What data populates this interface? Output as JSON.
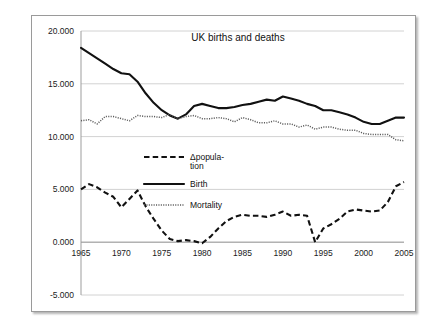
{
  "chart_data": {
    "type": "line",
    "title": "UK births and deaths",
    "xlabel": "",
    "ylabel": "",
    "xlim": [
      1965,
      2005
    ],
    "ylim": [
      -5.0,
      20.0
    ],
    "grid": true,
    "legend_position": "center",
    "xticks": [
      "1965",
      "1970",
      "1975",
      "1980",
      "1985",
      "1990",
      "1995",
      "2000",
      "2005"
    ],
    "yticks": [
      "-5.000",
      "0.000",
      "5.000",
      "10.000",
      "15.000",
      "20.000"
    ],
    "x": [
      1965,
      1966,
      1967,
      1968,
      1969,
      1970,
      1971,
      1972,
      1973,
      1974,
      1975,
      1976,
      1977,
      1978,
      1979,
      1980,
      1981,
      1982,
      1983,
      1984,
      1985,
      1986,
      1987,
      1988,
      1989,
      1990,
      1991,
      1992,
      1993,
      1994,
      1995,
      1996,
      1997,
      1998,
      1999,
      2000,
      2001,
      2002,
      2003,
      2004,
      2005
    ],
    "series": [
      {
        "name": "Δpopula-tion",
        "legend_label": "Δpopula-",
        "legend_label_line2": "tion",
        "style": "dashed",
        "color": "#111111",
        "values": [
          5.0,
          5.5,
          5.2,
          4.7,
          4.3,
          3.3,
          4.1,
          4.9,
          3.4,
          2.2,
          1.1,
          0.3,
          0.1,
          0.2,
          0.1,
          -0.1,
          0.5,
          1.3,
          2.0,
          2.4,
          2.6,
          2.5,
          2.5,
          2.4,
          2.6,
          2.9,
          2.5,
          2.6,
          2.5,
          0.0,
          1.3,
          1.7,
          2.2,
          2.9,
          3.1,
          3.0,
          2.9,
          3.0,
          3.8,
          5.3,
          5.7
        ]
      },
      {
        "name": "Birth",
        "legend_label": "Birth",
        "style": "solid",
        "color": "#111111",
        "values": [
          18.4,
          17.9,
          17.4,
          16.9,
          16.4,
          16.0,
          15.9,
          15.2,
          14.1,
          13.2,
          12.5,
          12.0,
          11.7,
          12.1,
          12.9,
          13.1,
          12.9,
          12.7,
          12.7,
          12.8,
          13.0,
          13.1,
          13.3,
          13.5,
          13.4,
          13.8,
          13.6,
          13.4,
          13.1,
          12.9,
          12.5,
          12.5,
          12.3,
          12.1,
          11.8,
          11.4,
          11.2,
          11.2,
          11.5,
          11.8,
          11.8
        ]
      },
      {
        "name": "Mortality",
        "legend_label": "Mortality",
        "style": "dotted",
        "color": "#5c5c5c",
        "values": [
          11.5,
          11.6,
          11.2,
          11.9,
          11.9,
          11.7,
          11.5,
          12.0,
          11.9,
          11.9,
          11.8,
          12.1,
          11.7,
          11.9,
          12.0,
          11.7,
          11.7,
          11.8,
          11.7,
          11.4,
          11.8,
          11.6,
          11.3,
          11.3,
          11.5,
          11.2,
          11.2,
          10.9,
          11.1,
          10.7,
          10.9,
          10.9,
          10.7,
          10.6,
          10.6,
          10.3,
          10.2,
          10.2,
          10.2,
          9.7,
          9.6
        ]
      }
    ]
  }
}
